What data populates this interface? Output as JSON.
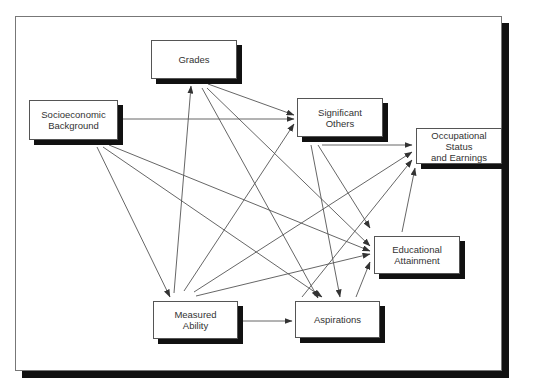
{
  "diagram": {
    "type": "path-diagram",
    "frame": {
      "x": 15,
      "y": 16,
      "w": 487,
      "h": 355,
      "shadow_color": "#111111"
    },
    "nodes": [
      {
        "id": "grades",
        "label": "Grades",
        "x": 151,
        "y": 40,
        "w": 86,
        "h": 39
      },
      {
        "id": "socio",
        "label": "Socioeconomic\nBackground",
        "x": 29,
        "y": 100,
        "w": 89,
        "h": 40
      },
      {
        "id": "sigothers",
        "label": "Significant\nOthers",
        "x": 297,
        "y": 98,
        "w": 86,
        "h": 39
      },
      {
        "id": "occupational",
        "label": "Occupational\nStatus\nand Earnings",
        "x": 416,
        "y": 128,
        "w": 86,
        "h": 36
      },
      {
        "id": "education",
        "label": "Educational\nAttainment",
        "x": 374,
        "y": 236,
        "w": 86,
        "h": 38
      },
      {
        "id": "ability",
        "label": "Measured\nAbility",
        "x": 153,
        "y": 301,
        "w": 85,
        "h": 38
      },
      {
        "id": "aspirations",
        "label": "Aspirations",
        "x": 295,
        "y": 301,
        "w": 85,
        "h": 37
      }
    ],
    "edges": [
      {
        "from": "socio",
        "to": "sigothers",
        "x1": 120,
        "y1": 119,
        "x2": 294,
        "y2": 119
      },
      {
        "from": "socio",
        "to": "ability",
        "x1": 97,
        "y1": 147,
        "x2": 170,
        "y2": 297
      },
      {
        "from": "socio",
        "to": "aspirations",
        "x1": 103,
        "y1": 147,
        "x2": 322,
        "y2": 297
      },
      {
        "from": "socio",
        "to": "education",
        "x1": 109,
        "y1": 145,
        "x2": 370,
        "y2": 251
      },
      {
        "from": "grades",
        "to": "sigothers",
        "x1": 208,
        "y1": 84,
        "x2": 294,
        "y2": 115
      },
      {
        "from": "grades",
        "to": "aspirations",
        "x1": 202,
        "y1": 88,
        "x2": 318,
        "y2": 298
      },
      {
        "from": "grades",
        "to": "education",
        "x1": 207,
        "y1": 88,
        "x2": 370,
        "y2": 246
      },
      {
        "from": "ability",
        "to": "grades",
        "x1": 174,
        "y1": 293,
        "x2": 191,
        "y2": 86
      },
      {
        "from": "ability",
        "to": "sigothers",
        "x1": 184,
        "y1": 291,
        "x2": 294,
        "y2": 124
      },
      {
        "from": "ability",
        "to": "occupational",
        "x1": 194,
        "y1": 292,
        "x2": 412,
        "y2": 152
      },
      {
        "from": "ability",
        "to": "education",
        "x1": 196,
        "y1": 296,
        "x2": 370,
        "y2": 254
      },
      {
        "from": "ability",
        "to": "aspirations",
        "x1": 240,
        "y1": 321,
        "x2": 292,
        "y2": 321
      },
      {
        "from": "sigothers",
        "to": "occupational",
        "x1": 322,
        "y1": 145,
        "x2": 412,
        "y2": 145
      },
      {
        "from": "sigothers",
        "to": "aspirations",
        "x1": 311,
        "y1": 145,
        "x2": 340,
        "y2": 297
      },
      {
        "from": "sigothers",
        "to": "education",
        "x1": 318,
        "y1": 145,
        "x2": 370,
        "y2": 228
      },
      {
        "from": "aspirations",
        "to": "education",
        "x1": 356,
        "y1": 297,
        "x2": 370,
        "y2": 262
      },
      {
        "from": "aspirations",
        "to": "occupational",
        "x1": 302,
        "y1": 297,
        "x2": 412,
        "y2": 160
      },
      {
        "from": "education",
        "to": "occupational",
        "x1": 402,
        "y1": 232,
        "x2": 415,
        "y2": 168
      }
    ]
  }
}
